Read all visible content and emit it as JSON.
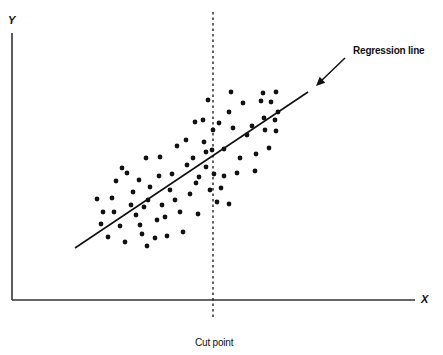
{
  "diagram": {
    "title": "",
    "y_axis_label": "Y",
    "x_axis_label": "X",
    "regression_label": "Regression line",
    "cut_label": "Cut point",
    "colors": {
      "ink": "#111111",
      "background": "#ffffff"
    },
    "axes": {
      "origin": [
        12,
        300
      ],
      "x_end": [
        415,
        300
      ],
      "y_top": [
        12,
        33
      ]
    },
    "regression_line": {
      "start": [
        75,
        248
      ],
      "end": [
        308,
        92
      ]
    },
    "arrow": {
      "from": [
        345,
        58
      ],
      "to": [
        316,
        86
      ]
    },
    "cut_line": {
      "x": 213,
      "y_top": 12,
      "y_bottom": 318
    },
    "points": [
      [
        97,
        199
      ],
      [
        103,
        212
      ],
      [
        101,
        224
      ],
      [
        108,
        237
      ],
      [
        112,
        198
      ],
      [
        116,
        181
      ],
      [
        114,
        212
      ],
      [
        120,
        226
      ],
      [
        125,
        242
      ],
      [
        127,
        173
      ],
      [
        122,
        168
      ],
      [
        131,
        205
      ],
      [
        133,
        192
      ],
      [
        136,
        215
      ],
      [
        140,
        225
      ],
      [
        144,
        207
      ],
      [
        147,
        246
      ],
      [
        148,
        200
      ],
      [
        142,
        234
      ],
      [
        150,
        187
      ],
      [
        146,
        158
      ],
      [
        139,
        180
      ],
      [
        155,
        238
      ],
      [
        157,
        220
      ],
      [
        159,
        176
      ],
      [
        160,
        157
      ],
      [
        162,
        205
      ],
      [
        165,
        217
      ],
      [
        167,
        236
      ],
      [
        170,
        190
      ],
      [
        172,
        174
      ],
      [
        175,
        200
      ],
      [
        177,
        146
      ],
      [
        180,
        212
      ],
      [
        183,
        232
      ],
      [
        186,
        140
      ],
      [
        187,
        165
      ],
      [
        190,
        194
      ],
      [
        193,
        158
      ],
      [
        195,
        122
      ],
      [
        196,
        183
      ],
      [
        198,
        214
      ],
      [
        199,
        177
      ],
      [
        203,
        120
      ],
      [
        204,
        142
      ],
      [
        206,
        152
      ],
      [
        206,
        167
      ],
      [
        208,
        100
      ],
      [
        210,
        190
      ],
      [
        212,
        150
      ],
      [
        213,
        130
      ],
      [
        214,
        174
      ],
      [
        219,
        123
      ],
      [
        224,
        149
      ],
      [
        224,
        176
      ],
      [
        229,
        112
      ],
      [
        231,
        92
      ],
      [
        233,
        128
      ],
      [
        237,
        173
      ],
      [
        240,
        158
      ],
      [
        243,
        103
      ],
      [
        247,
        135
      ],
      [
        252,
        126
      ],
      [
        255,
        171
      ],
      [
        256,
        154
      ],
      [
        261,
        101
      ],
      [
        263,
        93
      ],
      [
        264,
        118
      ],
      [
        265,
        130
      ],
      [
        271,
        102
      ],
      [
        275,
        120
      ],
      [
        276,
        92
      ],
      [
        278,
        112
      ],
      [
        276,
        131
      ],
      [
        269,
        148
      ],
      [
        229,
        204
      ],
      [
        217,
        202
      ],
      [
        221,
        188
      ]
    ]
  }
}
